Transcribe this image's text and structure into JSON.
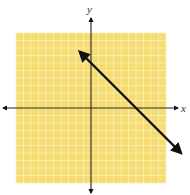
{
  "chart_data": {
    "type": "line",
    "title": "",
    "xlabel": "x",
    "ylabel": "y",
    "xlim": [
      -10,
      10
    ],
    "ylim": [
      -10,
      10
    ],
    "grid": true,
    "grid_step": 1,
    "legend": null,
    "series": [
      {
        "name": "line",
        "equation": "y = -x + 6",
        "slope": -1,
        "y_intercept": 6,
        "x_intercept": 6,
        "x": [
          -1.5,
          12
        ],
        "y": [
          7.5,
          -6
        ],
        "arrows": "both"
      }
    ]
  },
  "colors": {
    "grid_background": "#f5dc73",
    "grid_lines": "#fbefb8",
    "axes": "#222222",
    "line": "#111111"
  },
  "labels": {
    "x_axis": "x",
    "y_axis": "y"
  }
}
